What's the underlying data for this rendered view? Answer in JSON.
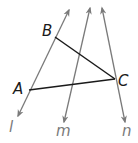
{
  "diagram": {
    "type": "geometry",
    "colors": {
      "background": "#ffffff",
      "line": "#7a7a7a",
      "segment": "#1a1a1a",
      "point_label": "#1a1a1a",
      "line_label": "#7a7a7a"
    },
    "points": [
      {
        "name": "A",
        "label": "A",
        "x": 29,
        "y": 90
      },
      {
        "name": "B",
        "label": "B",
        "x": 55,
        "y": 37
      },
      {
        "name": "C",
        "label": "C",
        "x": 115,
        "y": 79
      }
    ],
    "lines": [
      {
        "name": "l",
        "label": "l",
        "x1": 18,
        "y1": 116,
        "x2": 69,
        "y2": 10,
        "through": [
          "A",
          "B"
        ]
      },
      {
        "name": "m",
        "label": "m",
        "x1": 64,
        "y1": 122,
        "x2": 90,
        "y2": 8,
        "through": []
      },
      {
        "name": "n",
        "label": "n",
        "x1": 125,
        "y1": 122,
        "x2": 102,
        "y2": 8,
        "through": [
          "C"
        ]
      }
    ],
    "segments": [
      {
        "name": "BC",
        "from": "B",
        "to": "C"
      },
      {
        "name": "AC",
        "from": "A",
        "to": "C"
      }
    ],
    "labels": {
      "A": "A",
      "B": "B",
      "C": "C",
      "l": "l",
      "m": "m",
      "n": "n"
    }
  }
}
